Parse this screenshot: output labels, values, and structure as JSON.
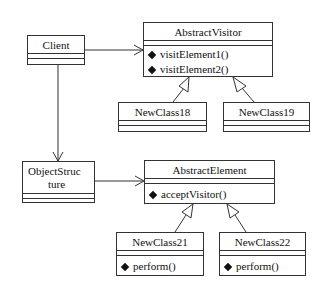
{
  "diagram": {
    "type": "UML class diagram",
    "pattern": "Visitor",
    "classes": {
      "client": {
        "name": "Client",
        "operations": []
      },
      "abstract_visitor": {
        "name": "AbstractVisitor",
        "operations": [
          "visitElement1()",
          "visitElement2()"
        ]
      },
      "new_class_18": {
        "name": "NewClass18",
        "operations": []
      },
      "new_class_19": {
        "name": "NewClass19",
        "operations": []
      },
      "object_structure": {
        "name_line1": "ObjectStruc",
        "name_line2": "ture",
        "operations": []
      },
      "abstract_element": {
        "name": "AbstractElement",
        "operations": [
          "acceptVisitor()"
        ]
      },
      "new_class_21": {
        "name": "NewClass21",
        "operations": [
          "perform()"
        ]
      },
      "new_class_22": {
        "name": "NewClass22",
        "operations": [
          "perform()"
        ]
      }
    },
    "relationships": [
      {
        "from": "Client",
        "to": "AbstractVisitor",
        "kind": "association"
      },
      {
        "from": "Client",
        "to": "ObjectStructure",
        "kind": "association"
      },
      {
        "from": "ObjectStructure",
        "to": "AbstractElement",
        "kind": "association"
      },
      {
        "from": "NewClass18",
        "to": "AbstractVisitor",
        "kind": "generalization"
      },
      {
        "from": "NewClass19",
        "to": "AbstractVisitor",
        "kind": "generalization"
      },
      {
        "from": "NewClass21",
        "to": "AbstractElement",
        "kind": "generalization"
      },
      {
        "from": "NewClass22",
        "to": "AbstractElement",
        "kind": "generalization"
      }
    ],
    "colors": {
      "line": "#333333",
      "background": "#ffffff",
      "diamond": "#111111"
    }
  }
}
